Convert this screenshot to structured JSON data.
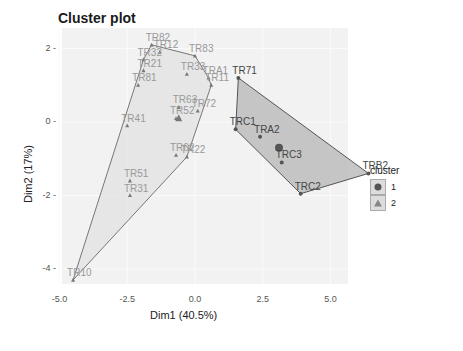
{
  "chart_data": {
    "type": "scatter",
    "title": "Cluster plot",
    "xlabel": "Dim1 (40.5%)",
    "ylabel": "Dim2 (17%)",
    "xlim": [
      -5.0,
      7.0
    ],
    "ylim": [
      -4.5,
      2.5
    ],
    "x_ticks": [
      "-5.0",
      "-2.5",
      "0.0",
      "2.5",
      "5.0"
    ],
    "y_ticks": [
      "2",
      "0",
      "-2",
      "-4"
    ],
    "grid": true,
    "legend": {
      "title": "cluster",
      "position": "right",
      "entries": [
        "1",
        "2"
      ]
    },
    "series": [
      {
        "name": "1",
        "marker": "circle",
        "color": "#555555",
        "fill": "#bdbdbd",
        "points": [
          {
            "label": "TR71",
            "x": 1.6,
            "y": 1.2
          },
          {
            "label": "TRC1",
            "x": 1.5,
            "y": -0.2
          },
          {
            "label": "TRA2",
            "x": 2.4,
            "y": -0.4
          },
          {
            "label": "TRC3",
            "x": 3.2,
            "y": -1.1
          },
          {
            "label": "TRC2",
            "x": 3.9,
            "y": -1.95
          },
          {
            "label": "TRB2",
            "x": 6.4,
            "y": -1.4
          }
        ],
        "centroid": {
          "x": 3.1,
          "y": -0.7
        }
      },
      {
        "name": "2",
        "marker": "triangle",
        "color": "#777777",
        "fill": "#dddddd",
        "points": [
          {
            "label": "TR82",
            "x": -1.6,
            "y": 2.1
          },
          {
            "label": "TR12",
            "x": -1.3,
            "y": 1.9
          },
          {
            "label": "TR32",
            "x": -1.9,
            "y": 1.7
          },
          {
            "label": "TR83",
            "x": 0.0,
            "y": 1.8
          },
          {
            "label": "TR21",
            "x": -1.9,
            "y": 1.4
          },
          {
            "label": "TR81",
            "x": -2.1,
            "y": 1.0
          },
          {
            "label": "TR33",
            "x": -0.3,
            "y": 1.3
          },
          {
            "label": "TRA1",
            "x": 0.5,
            "y": 1.2
          },
          {
            "label": "TR11",
            "x": 0.6,
            "y": 1.0
          },
          {
            "label": "TR63",
            "x": -0.6,
            "y": 0.4
          },
          {
            "label": "TR72",
            "x": 0.1,
            "y": 0.3
          },
          {
            "label": "TR52",
            "x": -0.7,
            "y": 0.1
          },
          {
            "label": "TR41",
            "x": -2.5,
            "y": -0.1
          },
          {
            "label": "TR62",
            "x": -0.7,
            "y": -0.9
          },
          {
            "label": "TR22",
            "x": -0.3,
            "y": -0.95
          },
          {
            "label": "TR51",
            "x": -2.4,
            "y": -1.6
          },
          {
            "label": "TR31",
            "x": -2.4,
            "y": -2.0
          },
          {
            "label": "TR10",
            "x": -4.5,
            "y": -4.3
          }
        ],
        "centroid": {
          "x": -0.6,
          "y": 0.1
        }
      }
    ]
  },
  "legend": {
    "title": "cluster",
    "items": [
      {
        "label": "1"
      },
      {
        "label": "2"
      }
    ]
  },
  "axes": {
    "xlabel": "Dim1 (40.5%)",
    "ylabel": "Dim2 (17%)"
  },
  "title": "Cluster plot"
}
